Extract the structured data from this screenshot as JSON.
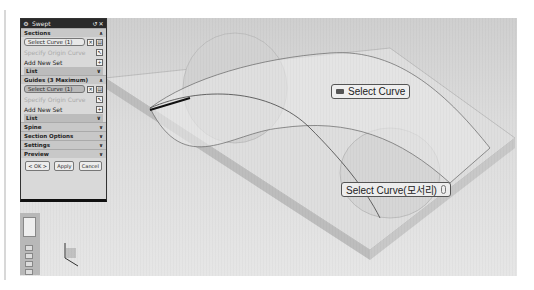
{
  "dialog": {
    "title": "Swept",
    "sections": {
      "header": "Sections",
      "select_curve": "Select Curve (1)",
      "specify_origin": "Specify Origin Curve",
      "add_new_set": "Add New Set",
      "list": "List"
    },
    "guides": {
      "header": "Guides (3 Maximum)",
      "select_curve": "Select Curve (1)",
      "specify_origin": "Specify Origin Curve",
      "add_new_set": "Add New Set",
      "list": "List"
    },
    "collapsed": [
      "Spine",
      "Section Options",
      "Settings",
      "Preview"
    ],
    "buttons": {
      "ok": "< OK >",
      "apply": "Apply",
      "cancel": "Cancel"
    }
  },
  "callouts": {
    "select_curve": "Select Curve",
    "select_curve_edge": "Select Curve(모서리)"
  }
}
